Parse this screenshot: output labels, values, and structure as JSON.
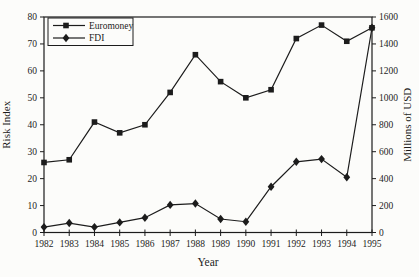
{
  "figure": {
    "background": "#fcfcfa",
    "line_color": "#1c1c1c",
    "text_color": "#1c1c1c"
  },
  "chart_data": {
    "type": "line",
    "title": "",
    "x": [
      1982,
      1983,
      1984,
      1985,
      1986,
      1987,
      1988,
      1989,
      1990,
      1991,
      1992,
      1993,
      1994,
      1995
    ],
    "series": [
      {
        "name": "Euromoney",
        "axis": "left",
        "marker": "square",
        "color": "#1c1c1c",
        "values": [
          26,
          27,
          41,
          37,
          40,
          52,
          66,
          56,
          50,
          53,
          72,
          77,
          71,
          76
        ]
      },
      {
        "name": "FDI",
        "axis": "right",
        "marker": "diamond",
        "color": "#1c1c1c",
        "values": [
          40,
          70,
          40,
          75,
          110,
          205,
          215,
          100,
          80,
          340,
          525,
          545,
          410,
          1520
        ]
      }
    ],
    "left_axis": {
      "label": "Risk Index",
      "min": 0,
      "max": 80,
      "tick_step": 10,
      "ticks": [
        0,
        10,
        20,
        30,
        40,
        50,
        60,
        70,
        80
      ]
    },
    "right_axis": {
      "label": "Millions of USD",
      "min": 0,
      "max": 1600,
      "tick_step": 200,
      "ticks": [
        0,
        200,
        400,
        600,
        800,
        1000,
        1200,
        1400,
        1600
      ]
    },
    "x_axis": {
      "label": "Year",
      "ticks": [
        1982,
        1983,
        1984,
        1985,
        1986,
        1987,
        1988,
        1989,
        1990,
        1991,
        1992,
        1993,
        1994,
        1995
      ]
    },
    "legend": {
      "position": "top-left",
      "border": true,
      "entries": [
        "Euromoney",
        "FDI"
      ]
    },
    "grid": false,
    "frame": true
  }
}
